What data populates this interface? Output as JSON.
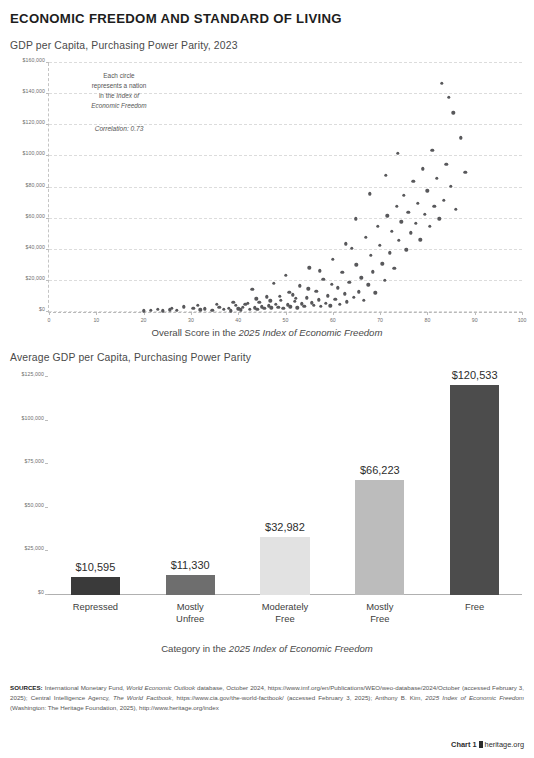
{
  "header": {
    "title": "ECONOMIC FREEDOM AND STANDARD OF LIVING"
  },
  "footer": {
    "chart_label": "Chart 1",
    "site": "heritage.org"
  },
  "sources": {
    "label": "SOURCES:",
    "part1": " International Monetary Fund, ",
    "italic1": "World Economic Outlook",
    "part2": " database, October 2024, https://www.imf.org/en/Publications/WEO/weo-database/2024/October (accessed February 3, 2025); Central Intelligence Agency, ",
    "italic2": "The World Factbook",
    "part3": ", https://www.cia.gov/the-world-factbook/ (accessed February 3, 2025); Anthony B. Kim, ",
    "italic3": "2025 Index of Economic Freedom",
    "part4": " (Washington: The Heritage Foundation, 2025), http://www.heritage.org/index"
  },
  "chart_data": [
    {
      "type": "scatter",
      "title": "GDP per Capita, Purchasing Power Parity, 2023",
      "xlabel_prefix": "Overall Score in the ",
      "xlabel_italic": "2025 Index of Economic Freedom",
      "ylabel": "",
      "xlim": [
        0,
        100
      ],
      "ylim": [
        0,
        160000
      ],
      "grid": true,
      "legend": "none",
      "annotation": {
        "line1": "Each circle",
        "line2": "represents a nation",
        "line3": "in the ",
        "line3_italic": "Index of",
        "line4_italic": "Economic Freedom",
        "correlation": "Correlation: 0.73"
      },
      "xticks": [
        0,
        10,
        20,
        30,
        40,
        50,
        60,
        70,
        80,
        90,
        100
      ],
      "xticklabels": [
        "0",
        "10",
        "20",
        "30",
        "40",
        "50",
        "60",
        "70",
        "80",
        "90",
        "100"
      ],
      "yticks": [
        0,
        20000,
        40000,
        60000,
        80000,
        100000,
        120000,
        140000,
        160000
      ],
      "yticklabels": [
        "$0",
        "$20,000",
        "$40,000",
        "$60,000",
        "$80,000",
        "$100,000",
        "$120,000",
        "$140,000",
        "$160,000"
      ],
      "point_color": "#58585b",
      "points": [
        [
          21.5,
          1200
        ],
        [
          24.0,
          900
        ],
        [
          25.5,
          1600
        ],
        [
          27.0,
          1100
        ],
        [
          30.5,
          2600
        ],
        [
          32.0,
          1400
        ],
        [
          33.0,
          2100
        ],
        [
          34.5,
          1300
        ],
        [
          36.0,
          3200
        ],
        [
          37.0,
          1800
        ],
        [
          38.0,
          2400
        ],
        [
          38.5,
          900
        ],
        [
          39.5,
          4200
        ],
        [
          40.0,
          2200
        ],
        [
          40.5,
          1500
        ],
        [
          41.0,
          3100
        ],
        [
          42.0,
          5600
        ],
        [
          42.5,
          2000
        ],
        [
          43.0,
          14500
        ],
        [
          43.5,
          2800
        ],
        [
          44.0,
          1700
        ],
        [
          44.5,
          6200
        ],
        [
          45.0,
          3400
        ],
        [
          45.5,
          2300
        ],
        [
          46.0,
          9800
        ],
        [
          46.5,
          4100
        ],
        [
          47.0,
          2700
        ],
        [
          47.5,
          18500
        ],
        [
          48.0,
          5200
        ],
        [
          48.5,
          3000
        ],
        [
          49.0,
          7400
        ],
        [
          49.5,
          2500
        ],
        [
          50.0,
          23500
        ],
        [
          50.5,
          4600
        ],
        [
          51.0,
          3300
        ],
        [
          51.5,
          11200
        ],
        [
          52.0,
          6800
        ],
        [
          52.5,
          2900
        ],
        [
          53.0,
          16800
        ],
        [
          53.5,
          5400
        ],
        [
          54.0,
          3700
        ],
        [
          54.5,
          9100
        ],
        [
          55.0,
          28500
        ],
        [
          55.5,
          6100
        ],
        [
          56.0,
          4300
        ],
        [
          56.5,
          13400
        ],
        [
          57.0,
          7900
        ],
        [
          57.5,
          3600
        ],
        [
          58.0,
          21000
        ],
        [
          58.5,
          5800
        ],
        [
          59.0,
          10500
        ],
        [
          59.5,
          4000
        ],
        [
          60.0,
          34000
        ],
        [
          60.5,
          8200
        ],
        [
          61.0,
          15600
        ],
        [
          61.5,
          5100
        ],
        [
          62.0,
          25500
        ],
        [
          62.5,
          11800
        ],
        [
          63.0,
          6700
        ],
        [
          63.5,
          19200
        ],
        [
          64.0,
          41000
        ],
        [
          64.5,
          9400
        ],
        [
          65.0,
          30500
        ],
        [
          65.5,
          13000
        ],
        [
          66.0,
          22000
        ],
        [
          66.5,
          7600
        ],
        [
          67.0,
          48000
        ],
        [
          67.5,
          17500
        ],
        [
          68.0,
          36500
        ],
        [
          68.5,
          26000
        ],
        [
          69.0,
          12500
        ],
        [
          69.5,
          55000
        ],
        [
          70.0,
          43000
        ],
        [
          70.5,
          31000
        ],
        [
          71.0,
          20500
        ],
        [
          71.5,
          62000
        ],
        [
          72.0,
          38000
        ],
        [
          72.5,
          52000
        ],
        [
          73.0,
          28000
        ],
        [
          73.5,
          68000
        ],
        [
          74.0,
          46000
        ],
        [
          74.5,
          58000
        ],
        [
          75.0,
          75000
        ],
        [
          75.5,
          40000
        ],
        [
          76.0,
          64000
        ],
        [
          76.5,
          51000
        ],
        [
          77.0,
          84000
        ],
        [
          77.5,
          57000
        ],
        [
          78.0,
          70000
        ],
        [
          78.5,
          46500
        ],
        [
          79.0,
          92000
        ],
        [
          79.5,
          63000
        ],
        [
          80.0,
          78000
        ],
        [
          80.5,
          55000
        ],
        [
          81.0,
          104000
        ],
        [
          81.5,
          68000
        ],
        [
          82.0,
          86000
        ],
        [
          82.5,
          60000
        ],
        [
          83.0,
          147000
        ],
        [
          83.5,
          72000
        ],
        [
          84.0,
          95000
        ],
        [
          84.5,
          138000
        ],
        [
          85.0,
          81000
        ],
        [
          85.5,
          128000
        ],
        [
          86.0,
          66000
        ],
        [
          87.0,
          112000
        ],
        [
          88.0,
          90000
        ],
        [
          73.8,
          102000
        ],
        [
          67.8,
          76000
        ],
        [
          71.2,
          88000
        ],
        [
          64.8,
          60000
        ],
        [
          62.8,
          44000
        ],
        [
          59.8,
          18000
        ],
        [
          57.2,
          26500
        ],
        [
          54.8,
          15000
        ],
        [
          52.2,
          8800
        ],
        [
          50.8,
          12800
        ],
        [
          48.8,
          10200
        ],
        [
          46.8,
          7200
        ],
        [
          43.8,
          8500
        ],
        [
          41.5,
          4900
        ],
        [
          39.0,
          6400
        ],
        [
          35.5,
          5000
        ],
        [
          31.5,
          4400
        ],
        [
          28.5,
          3500
        ],
        [
          26.0,
          2400
        ],
        [
          23.0,
          1900
        ],
        [
          20.0,
          800
        ]
      ]
    },
    {
      "type": "bar",
      "title": "Average GDP per Capita, Purchasing Power Parity",
      "xlabel_prefix": "Category in the ",
      "xlabel_italic": "2025 Index of Economic Freedom",
      "ylim": [
        0,
        125000
      ],
      "grid": false,
      "legend": "none",
      "yticks": [
        0,
        25000,
        50000,
        75000,
        100000,
        125000
      ],
      "yticklabels": [
        "$0",
        "$25,000",
        "$50,000",
        "$75,000",
        "$100,000",
        "$125,000"
      ],
      "categories": [
        "Repressed",
        "Mostly\nUnfree",
        "Moderately\nFree",
        "Mostly\nFree",
        "Free"
      ],
      "values": [
        10595,
        11330,
        32982,
        66223,
        120533
      ],
      "value_labels": [
        "$10,595",
        "$11,330",
        "$32,982",
        "$66,223",
        "$120,533"
      ],
      "bar_colors": [
        "#3a3a3a",
        "#6e6e6e",
        "#e2e2e2",
        "#bcbcbc",
        "#4c4c4c"
      ]
    }
  ]
}
